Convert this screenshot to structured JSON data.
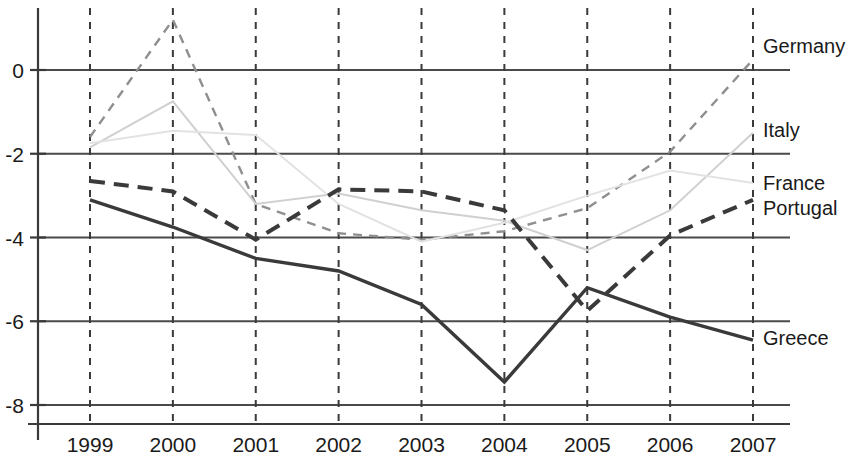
{
  "chart_data": {
    "type": "line",
    "title": "",
    "subtitle": "",
    "xlabel": "",
    "ylabel": "",
    "categories": [
      "1999",
      "2000",
      "2001",
      "2002",
      "2003",
      "2004",
      "2005",
      "2006",
      "2007"
    ],
    "x_tick_labels": [
      "1999",
      "2000",
      "2001",
      "2002",
      "2003",
      "2004",
      "2005",
      "2006",
      "2007"
    ],
    "y_tick_labels": [
      "0",
      "-2",
      "-4",
      "-6",
      "-8"
    ],
    "y_tick_values": [
      0,
      -2,
      -4,
      -6,
      -8
    ],
    "ylim": [
      -8.6,
      1.6
    ],
    "xlim": [
      "1999",
      "2007"
    ],
    "grid": true,
    "grid_axis": "both",
    "grid_style_horizontal": "solid",
    "grid_style_vertical": "dashed",
    "legend": "right-of-plot-inline",
    "series": [
      {
        "name": "Germany",
        "values": [
          -1.6,
          1.2,
          -3.2,
          -3.9,
          -4.05,
          -3.85,
          -3.3,
          -1.95,
          0.25
        ],
        "style": "dashed",
        "color": "#8f8f8f",
        "width": 2.4
      },
      {
        "name": "Italy",
        "values": [
          -1.85,
          -0.75,
          -3.2,
          -2.95,
          -3.35,
          -3.6,
          -4.3,
          -3.35,
          -1.5
        ],
        "style": "solid",
        "color": "#d0d0d0",
        "width": 2.0
      },
      {
        "name": "France",
        "values": [
          -1.75,
          -1.45,
          -1.55,
          -3.2,
          -4.1,
          -3.65,
          -3.0,
          -2.4,
          -2.7
        ],
        "style": "solid",
        "color": "#e2e2e2",
        "width": 2.0
      },
      {
        "name": "Portugal",
        "values": [
          -2.65,
          -2.9,
          -4.05,
          -2.85,
          -2.9,
          -3.35,
          -5.75,
          -3.95,
          -3.1
        ],
        "style": "dashed",
        "color": "#3a3a3a",
        "width": 4.0
      },
      {
        "name": "Greece",
        "values": [
          -3.1,
          -3.75,
          -4.5,
          -4.8,
          -5.6,
          -7.45,
          -5.2,
          -5.9,
          -6.45
        ],
        "style": "solid",
        "color": "#3a3a3a",
        "width": 3.4
      }
    ],
    "legend_entries": [
      {
        "label": "Germany",
        "series": "Germany"
      },
      {
        "label": "Italy",
        "series": "Italy"
      },
      {
        "label": "France",
        "series": "France"
      },
      {
        "label": "Portugal",
        "series": "Portugal"
      },
      {
        "label": "Greece",
        "series": "Greece"
      }
    ],
    "colors": {
      "axis": "#3a3a3a",
      "gridline": "#4a4a4a",
      "background": "#ffffff",
      "text": "#1a1a1a"
    }
  }
}
